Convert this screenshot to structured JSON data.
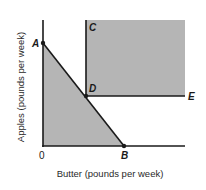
{
  "diagram": {
    "axes": {
      "x_label": "Butter (pounds per week)",
      "y_label": "Apples (pounds per week)",
      "origin_label": "0"
    },
    "points": {
      "A": "A",
      "B": "B",
      "C": "C",
      "D": "D",
      "E": "E"
    },
    "colors": {
      "shade": "#b5b5b5",
      "line": "#1a1a1a",
      "background": "#ffffff"
    },
    "regions": [
      {
        "name": "budget-set",
        "description": "Triangle 0-A-B shaded"
      },
      {
        "name": "preferred-set",
        "description": "Rectangle above and right of D (C-D-E corner) shaded"
      }
    ]
  }
}
